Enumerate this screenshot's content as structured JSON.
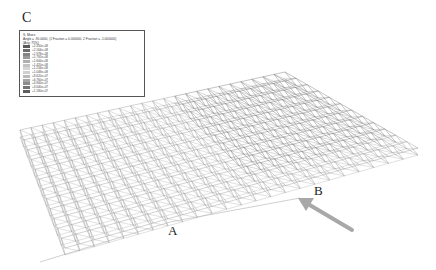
{
  "figure": {
    "panel_labels": {
      "c": "C",
      "a": "A",
      "b": "B"
    },
    "legend": {
      "title": "S, Mises",
      "subtitle": "Angle = -90.0000, (1 Fraction = 0.000000, 2 Fraction = -1.000000)",
      "averaging": "(Avg: 75%)",
      "bands": [
        {
          "value": "+2.350e+08",
          "color": "#5a5a5a"
        },
        {
          "value": "+2.164e+08",
          "color": "#6e6e6e"
        },
        {
          "value": "+1.978e+08",
          "color": "#858585"
        },
        {
          "value": "+1.792e+08",
          "color": "#9a9a9a"
        },
        {
          "value": "+1.606e+08",
          "color": "#b0b0b0"
        },
        {
          "value": "+1.420e+08",
          "color": "#c4c4c4"
        },
        {
          "value": "+1.234e+08",
          "color": "#d6d6d6"
        },
        {
          "value": "+1.048e+08",
          "color": "#cfcfcf"
        },
        {
          "value": "+8.620e+07",
          "color": "#bababa"
        },
        {
          "value": "+6.760e+07",
          "color": "#a4a4a4"
        },
        {
          "value": "+4.900e+07",
          "color": "#8c8c8c"
        },
        {
          "value": "+3.040e+07",
          "color": "#747474"
        },
        {
          "value": "+1.180e+07",
          "color": "#5e5e5e"
        }
      ]
    },
    "arrow": {
      "color": "#a8a8a8",
      "points_to": "collapsed-region-near-B"
    },
    "structure": {
      "type": "space truss roof",
      "line_color": "#9a9a9a",
      "dense_color": "#7a7a7a"
    }
  }
}
